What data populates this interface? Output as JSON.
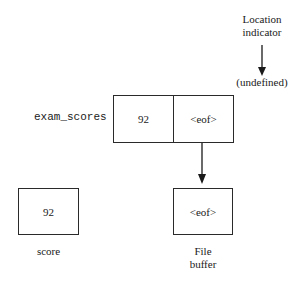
{
  "diagram": {
    "location_indicator": {
      "label_line1": "Location",
      "label_line2": "indicator",
      "value": "(undefined)"
    },
    "stream": {
      "name": "exam_scores",
      "cells": [
        "92",
        "<eof>"
      ]
    },
    "variable": {
      "name": "score",
      "value": "92"
    },
    "file_buffer": {
      "label_line1": "File",
      "label_line2": "buffer",
      "value": "<eof>"
    }
  }
}
